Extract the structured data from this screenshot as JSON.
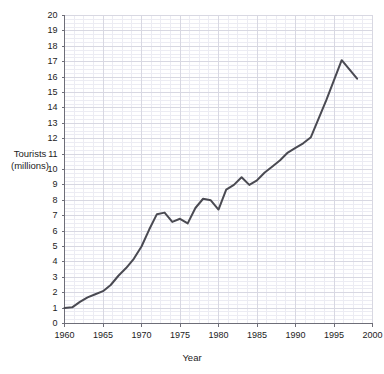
{
  "chart_data": {
    "type": "line",
    "title": "",
    "xlabel": "Year",
    "ylabel": "Tourists (millions)",
    "ylabel_line1": "Tourists",
    "ylabel_line2": "(millions)",
    "xlim": [
      1960,
      2000
    ],
    "ylim": [
      0,
      20
    ],
    "grid": true,
    "minor_grid": true,
    "legend": "none",
    "line_color": "#4a4a52",
    "grid_color": "#d8d8e2",
    "minor_grid_color": "#ececf3",
    "axis_color": "#6e6e78",
    "xticks": [
      1960,
      1965,
      1970,
      1975,
      1980,
      1985,
      1990,
      1995,
      2000
    ],
    "xtick_labels": [
      "1960",
      "1965",
      "1970",
      "1975",
      "1980",
      "1985",
      "1990",
      "1995",
      "2000"
    ],
    "yticks": [
      0,
      1,
      2,
      3,
      4,
      5,
      6,
      7,
      8,
      9,
      10,
      11,
      12,
      13,
      14,
      15,
      16,
      17,
      18,
      19,
      20
    ],
    "ytick_labels": [
      "0",
      "1",
      "2",
      "3",
      "4",
      "5",
      "6",
      "7",
      "8",
      "9",
      "10",
      "11",
      "12",
      "13",
      "14",
      "15",
      "16",
      "17",
      "18",
      "19",
      "20"
    ],
    "series": [
      {
        "name": "Tourists",
        "x": [
          1960,
          1961,
          1962,
          1963,
          1964,
          1965,
          1966,
          1967,
          1968,
          1969,
          1970,
          1971,
          1972,
          1973,
          1974,
          1975,
          1976,
          1977,
          1978,
          1979,
          1980,
          1981,
          1982,
          1983,
          1984,
          1985,
          1986,
          1987,
          1988,
          1989,
          1990,
          1991,
          1992,
          1993,
          1994,
          1995,
          1996,
          1997,
          1998
        ],
        "values": [
          1.0,
          1.05,
          1.4,
          1.7,
          1.9,
          2.1,
          2.5,
          3.1,
          3.6,
          4.2,
          5.0,
          6.1,
          7.1,
          7.2,
          6.6,
          6.8,
          6.5,
          7.5,
          8.1,
          8.0,
          7.4,
          8.7,
          9.0,
          9.5,
          9.0,
          9.3,
          9.8,
          10.2,
          10.6,
          11.1,
          11.4,
          11.7,
          12.1,
          13.3,
          14.5,
          15.8,
          17.1,
          16.5,
          15.9
        ]
      }
    ]
  },
  "axis": {
    "ylabel_line1": "Tourists",
    "ylabel_line2": "(millions)",
    "xlabel": "Year"
  }
}
